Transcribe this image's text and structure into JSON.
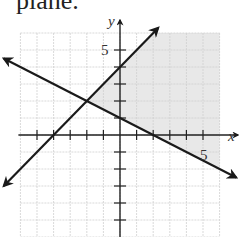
{
  "caption": "plane.",
  "chart_data": {
    "type": "line",
    "title": "",
    "xlabel": "x",
    "ylabel": "y",
    "xlim": [
      -6,
      6
    ],
    "ylim": [
      -6,
      6
    ],
    "grid": true,
    "tick_labels": {
      "x": [
        "5"
      ],
      "y": [
        "5"
      ]
    },
    "series": [
      {
        "name": "line 1",
        "equation": "y = x + 4",
        "slope": 1,
        "intercept": 4,
        "x_intercept": -4,
        "arrows": "both"
      },
      {
        "name": "line 2",
        "equation": "y = -x/2 + 1",
        "slope": -0.5,
        "intercept": 1,
        "x_intercept": 2,
        "arrows": "both"
      }
    ],
    "intersection": [
      -2,
      2
    ],
    "shaded_region": {
      "description": "y >= -x/2 + 1 and y <= x + 4",
      "color": "#e6e6e6"
    },
    "colors": {
      "line": "#1a1a1a",
      "grid": "#cfcfcf",
      "axis": "#222222",
      "shade": "#e8e8e8"
    }
  }
}
